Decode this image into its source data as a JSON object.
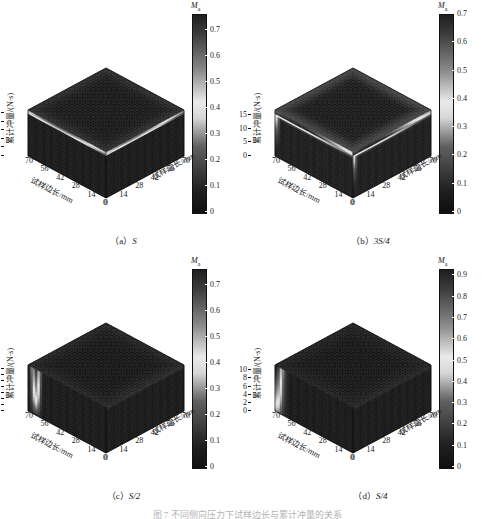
{
  "figure": {
    "caption_partial": "图 7    不同侧向压力下试样边长与累计冲量的关系"
  },
  "axis": {
    "z_label": "累计冲量/(N·s)",
    "x_label_left": "试样边长/mm",
    "x_label_right": "试样边长/mm",
    "horizontal_ticks_left": [
      "70",
      "56",
      "42",
      "28",
      "14",
      "0"
    ],
    "horizontal_ticks_right": [
      "0",
      "14",
      "28",
      "42",
      "56",
      "70"
    ],
    "colorbar_title_main": "M",
    "colorbar_title_sub": "a"
  },
  "panels": [
    {
      "id": "a",
      "caption_prefix": "（a）",
      "caption_name": "S",
      "z_ticks": [
        "0",
        "5",
        "10",
        "15",
        "20",
        "25"
      ],
      "z_max": 27,
      "cbar_ticks": [
        "0",
        "0.1",
        "0.2",
        "0.3",
        "0.4",
        "0.5",
        "0.6",
        "0.7"
      ],
      "cbar_max": 0.76,
      "cbar_min": 0
    },
    {
      "id": "b",
      "caption_prefix": "（b）",
      "caption_name": "3S/4",
      "z_ticks": [
        "0",
        "5",
        "10",
        "15"
      ],
      "z_max": 17,
      "cbar_ticks": [
        "0",
        "0.1",
        "0.2",
        "0.3",
        "0.4",
        "0.5",
        "0.6",
        "0.7"
      ],
      "cbar_max": 0.7,
      "cbar_min": 0
    },
    {
      "id": "c",
      "caption_prefix": "（c）",
      "caption_name": "S/2",
      "z_ticks": [
        "0",
        "2",
        "4",
        "6",
        "8",
        "10",
        "12",
        "14"
      ],
      "z_max": 15.2,
      "cbar_ticks": [
        "0",
        "0.1",
        "0.2",
        "0.3",
        "0.4",
        "0.5",
        "0.6",
        "0.7"
      ],
      "cbar_max": 0.76,
      "cbar_min": 0
    },
    {
      "id": "d",
      "caption_prefix": "（d）",
      "caption_name": "S/4",
      "z_ticks": [
        "0",
        "2",
        "4",
        "6",
        "8",
        "10"
      ],
      "z_max": 11.3,
      "cbar_ticks": [
        "0",
        "0.1",
        "0.2",
        "0.3",
        "0.4",
        "0.5",
        "0.6",
        "0.7",
        "0.8",
        "0.9"
      ],
      "cbar_max": 0.93,
      "cbar_min": 0
    }
  ],
  "chart_data": {
    "type": "surface",
    "n_panels": 4,
    "colormap": "jet-grayscale",
    "zlabel": "累计冲量/(N·s)",
    "xlabel": "试样边长/mm",
    "ylabel": "试样边长/mm",
    "clabel": "M_a",
    "shared_x": [
      0,
      14,
      28,
      42,
      56,
      70
    ],
    "shared_y": [
      0,
      14,
      28,
      42,
      56,
      70
    ],
    "panels": [
      {
        "panel": "a",
        "title": "(a) S",
        "zlim": [
          0,
          27
        ],
        "zticks": [
          0,
          5,
          10,
          15,
          20,
          25
        ],
        "clim": [
          0,
          0.76
        ],
        "cticks": [
          0,
          0.1,
          0.2,
          0.3,
          0.4,
          0.5,
          0.6,
          0.7
        ],
        "surface_note": "Near-uniform low M_a (<0.15) over most of the block; bright ridge (M_a up to ~0.75) concentrated along the upper rear edges of the box where impulse is maximal and side length is small.",
        "sample_values": [
          {
            "x": 70,
            "y": 0,
            "z": 27,
            "Ma": 0.1
          },
          {
            "x": 56,
            "y": 14,
            "z": 27,
            "Ma": 0.42
          },
          {
            "x": 42,
            "y": 28,
            "z": 27,
            "Ma": 0.68
          },
          {
            "x": 28,
            "y": 42,
            "z": 27,
            "Ma": 0.72
          },
          {
            "x": 14,
            "y": 56,
            "z": 27,
            "Ma": 0.6
          },
          {
            "x": 0,
            "y": 70,
            "z": 27,
            "Ma": 0.3
          },
          {
            "x": 35,
            "y": 35,
            "z": 13,
            "Ma": 0.08
          },
          {
            "x": 35,
            "y": 35,
            "z": 0,
            "Ma": 0.04
          }
        ]
      },
      {
        "panel": "b",
        "title": "(b) 3S/4",
        "zlim": [
          0,
          17
        ],
        "zticks": [
          0,
          5,
          10,
          15
        ],
        "clim": [
          0,
          0.7
        ],
        "cticks": [
          0,
          0.1,
          0.2,
          0.3,
          0.4,
          0.5,
          0.6,
          0.7
        ],
        "surface_note": "Broad bright band following both upper edges, M_a peaking near 0.65 at the top corner; interior of the block remains near 0.05-0.15.",
        "sample_values": [
          {
            "x": 70,
            "y": 0,
            "z": 17,
            "Ma": 0.18
          },
          {
            "x": 56,
            "y": 14,
            "z": 17,
            "Ma": 0.5
          },
          {
            "x": 42,
            "y": 28,
            "z": 17,
            "Ma": 0.65
          },
          {
            "x": 28,
            "y": 42,
            "z": 17,
            "Ma": 0.62
          },
          {
            "x": 14,
            "y": 56,
            "z": 17,
            "Ma": 0.48
          },
          {
            "x": 0,
            "y": 70,
            "z": 17,
            "Ma": 0.22
          },
          {
            "x": 35,
            "y": 35,
            "z": 8,
            "Ma": 0.1
          },
          {
            "x": 35,
            "y": 35,
            "z": 0,
            "Ma": 0.05
          }
        ]
      },
      {
        "panel": "c",
        "title": "(c) S/2",
        "zlim": [
          0,
          15.2
        ],
        "zticks": [
          0,
          2,
          4,
          6,
          8,
          10,
          12,
          14
        ],
        "clim": [
          0,
          0.76
        ],
        "cticks": [
          0,
          0.1,
          0.2,
          0.3,
          0.4,
          0.5,
          0.6,
          0.7
        ],
        "surface_note": "A single narrow bright streak on the left-front face around the 56 mm side-length column, rising to M_a ~0.7; the rest of the block is uniformly dark (M_a < 0.1).",
        "sample_values": [
          {
            "x": 70,
            "y": 0,
            "z": 15,
            "Ma": 0.25
          },
          {
            "x": 63,
            "y": 0,
            "z": 13,
            "Ma": 0.7
          },
          {
            "x": 56,
            "y": 0,
            "z": 11,
            "Ma": 0.45
          },
          {
            "x": 42,
            "y": 28,
            "z": 15,
            "Ma": 0.12
          },
          {
            "x": 14,
            "y": 56,
            "z": 15,
            "Ma": 0.08
          },
          {
            "x": 35,
            "y": 35,
            "z": 7,
            "Ma": 0.06
          },
          {
            "x": 35,
            "y": 35,
            "z": 0,
            "Ma": 0.03
          }
        ]
      },
      {
        "panel": "d",
        "title": "(d) S/4",
        "zlim": [
          0,
          11.3
        ],
        "zticks": [
          0,
          2,
          4,
          6,
          8,
          10
        ],
        "clim": [
          0,
          0.93
        ],
        "cticks": [
          0,
          0.1,
          0.2,
          0.3,
          0.4,
          0.5,
          0.6,
          0.7,
          0.8,
          0.9
        ],
        "surface_note": "Strong bright vertical plume on the left-front face near the 70 mm edge, reaching M_a ~0.9 and extending down toward low impulse; remainder of the block near 0.05.",
        "sample_values": [
          {
            "x": 70,
            "y": 0,
            "z": 11,
            "Ma": 0.88
          },
          {
            "x": 70,
            "y": 0,
            "z": 6,
            "Ma": 0.6
          },
          {
            "x": 70,
            "y": 0,
            "z": 2,
            "Ma": 0.35
          },
          {
            "x": 56,
            "y": 14,
            "z": 11,
            "Ma": 0.3
          },
          {
            "x": 28,
            "y": 42,
            "z": 11,
            "Ma": 0.1
          },
          {
            "x": 35,
            "y": 35,
            "z": 5,
            "Ma": 0.05
          },
          {
            "x": 35,
            "y": 35,
            "z": 0,
            "Ma": 0.03
          }
        ]
      }
    ]
  }
}
